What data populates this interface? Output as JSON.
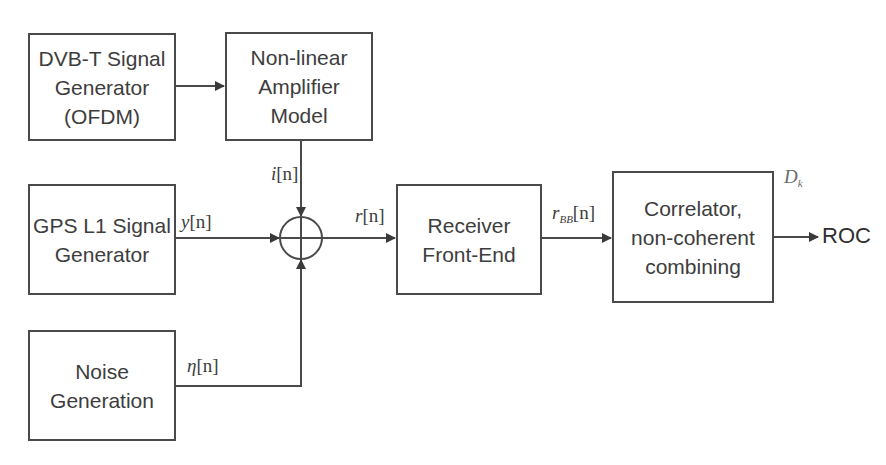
{
  "diagram": {
    "title": "",
    "blocks": [
      {
        "id": "dvbt",
        "lines": [
          "DVB-T Signal",
          "Generator",
          "(OFDM)"
        ]
      },
      {
        "id": "amp",
        "lines": [
          "Non-linear",
          "Amplifier",
          "Model"
        ]
      },
      {
        "id": "gps",
        "lines": [
          "GPS L1 Signal",
          "Generator"
        ]
      },
      {
        "id": "noise",
        "lines": [
          "Noise",
          "Generation"
        ]
      },
      {
        "id": "rx",
        "lines": [
          "Receiver",
          "Front-End"
        ]
      },
      {
        "id": "corr",
        "lines": [
          "Correlator,",
          "non-coherent",
          "combining"
        ]
      }
    ],
    "summing_junction": {
      "symbol": "⊕",
      "inputs": [
        "i[n]",
        "y[n]",
        "η[n]"
      ],
      "output": "r[n]"
    },
    "signals": {
      "i": {
        "base": "i",
        "index": "[n]"
      },
      "y": {
        "base": "y",
        "index": "[n]"
      },
      "eta": {
        "base": "η",
        "index": "[n]"
      },
      "r": {
        "base": "r",
        "index": "[n]"
      },
      "rbb": {
        "base": "r",
        "sub": "BB",
        "index": "[n]"
      },
      "dk": {
        "base": "D",
        "sub": "k"
      }
    },
    "output": {
      "label": "ROC"
    },
    "edges": [
      {
        "from": "dvbt",
        "to": "amp"
      },
      {
        "from": "amp",
        "to": "sum",
        "label": "i[n]"
      },
      {
        "from": "gps",
        "to": "sum",
        "label": "y[n]"
      },
      {
        "from": "noise",
        "to": "sum",
        "label": "η[n]"
      },
      {
        "from": "sum",
        "to": "rx",
        "label": "r[n]"
      },
      {
        "from": "rx",
        "to": "corr",
        "label": "r_BB[n]"
      },
      {
        "from": "corr",
        "to": "ROC",
        "label": "D_k"
      }
    ],
    "colors": {
      "stroke": "#4a4a4a",
      "text": "#3d3d3d",
      "background": "#ffffff"
    }
  }
}
